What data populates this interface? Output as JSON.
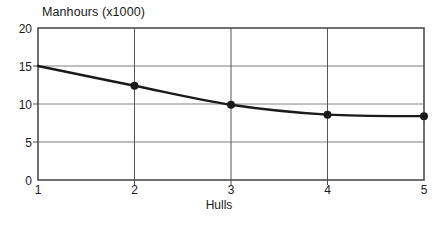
{
  "chart_data": {
    "type": "line",
    "title": "Manhours (x1000)",
    "xlabel": "Hulls",
    "ylabel": "",
    "x": [
      1,
      2,
      3,
      4,
      5
    ],
    "values": [
      15,
      12.4,
      9.9,
      8.6,
      8.4
    ],
    "series": [
      {
        "name": "Manhours",
        "values": [
          15,
          12.4,
          9.9,
          8.6,
          8.4
        ]
      }
    ],
    "xlim": [
      1,
      5
    ],
    "ylim": [
      0,
      20
    ],
    "xticks": [
      "1",
      "2",
      "3",
      "4",
      "5"
    ],
    "yticks": [
      "0",
      "5",
      "10",
      "15",
      "20"
    ],
    "grid": "both",
    "legend": "none",
    "marker": "filled-circle",
    "markers_shown_at_x": [
      2,
      3,
      4,
      5
    ],
    "line_color": "#1a1a1a",
    "grid_color": "#808080",
    "axis_color": "#4d4d4d",
    "background": "#ffffff"
  }
}
